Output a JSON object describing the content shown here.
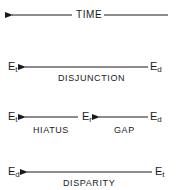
{
  "time_axis": {
    "label": "TIME",
    "direction": "right-to-left"
  },
  "rows": [
    {
      "name": "disjunction",
      "left": {
        "base": "E",
        "sub": "t"
      },
      "right": {
        "base": "E",
        "sub": "d"
      },
      "label": "DISJUNCTION"
    },
    {
      "name": "hiatus-gap",
      "left": {
        "base": "E",
        "sub": "t"
      },
      "middle": {
        "base": "E",
        "sub": "r"
      },
      "right": {
        "base": "E",
        "sub": "d"
      },
      "label_left": "HIATUS",
      "label_right": "GAP"
    },
    {
      "name": "disparity",
      "left": {
        "base": "E",
        "sub": "d"
      },
      "right": {
        "base": "E",
        "sub": "t"
      },
      "label": "DISPARITY"
    }
  ],
  "colors": {
    "ink": "#1a1a1a",
    "background": "#ffffff"
  }
}
